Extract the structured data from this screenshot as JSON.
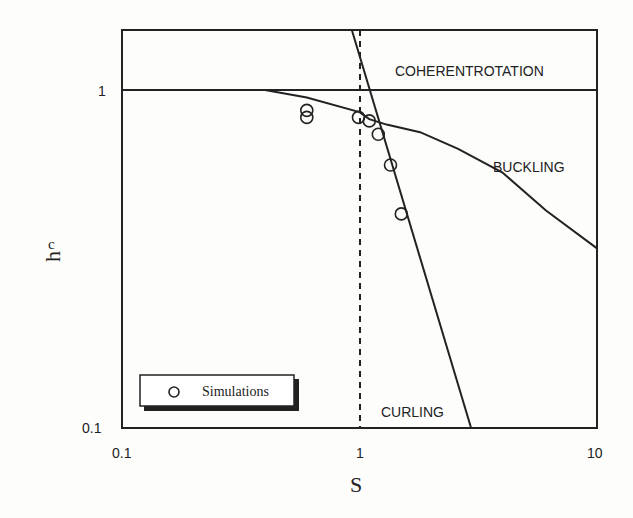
{
  "header_fragment": "a. Co  .  . p",
  "chart_data": {
    "type": "line",
    "title": "",
    "xlabel": "S",
    "ylabel": "h_c",
    "xscale": "log",
    "yscale": "log",
    "xlim": [
      0.1,
      10
    ],
    "ylim": [
      0.1,
      1.5
    ],
    "x_ticks": [
      "0.1",
      "1",
      "10"
    ],
    "y_ticks": [
      "0.1",
      "1"
    ],
    "grid": false,
    "regions": [
      "COHERENTROTATION",
      "BUCKLING",
      "CURLING"
    ],
    "reference_lines": [
      {
        "type": "horizontal",
        "y": 1.0,
        "style": "solid"
      },
      {
        "type": "vertical",
        "x": 1.0,
        "style": "dashed"
      }
    ],
    "series": [
      {
        "name": "Buckling boundary",
        "style": "line",
        "x": [
          0.4,
          0.6,
          1.0,
          1.1,
          1.3,
          1.8,
          2.6,
          4.0,
          6.1,
          10.0
        ],
        "y": [
          1.0,
          0.95,
          0.86,
          0.82,
          0.79,
          0.75,
          0.67,
          0.57,
          0.44,
          0.34
        ]
      },
      {
        "name": "Curling boundary",
        "style": "line",
        "x": [
          0.93,
          2.95
        ],
        "y": [
          1.5,
          0.1
        ]
      },
      {
        "name": "Simulations",
        "style": "marker-open-circle",
        "x": [
          0.6,
          0.6,
          0.99,
          1.1,
          1.2,
          1.35,
          1.5
        ],
        "y": [
          0.87,
          0.83,
          0.83,
          0.81,
          0.74,
          0.6,
          0.43
        ]
      }
    ],
    "legend": {
      "entries": [
        "Simulations"
      ],
      "position": "lower-left"
    }
  },
  "labels": {
    "y_tick_1": "1",
    "y_tick_01": "0.1",
    "x_tick_01": "0.1",
    "x_tick_1": "1",
    "x_tick_10": "10",
    "xlabel": "S",
    "ylabel_main": "h",
    "ylabel_sub": "c",
    "region_coherent": "COHERENTROTATION",
    "region_buckling": "BUCKLING",
    "region_curling": "CURLING",
    "legend_label": "Simulations"
  }
}
